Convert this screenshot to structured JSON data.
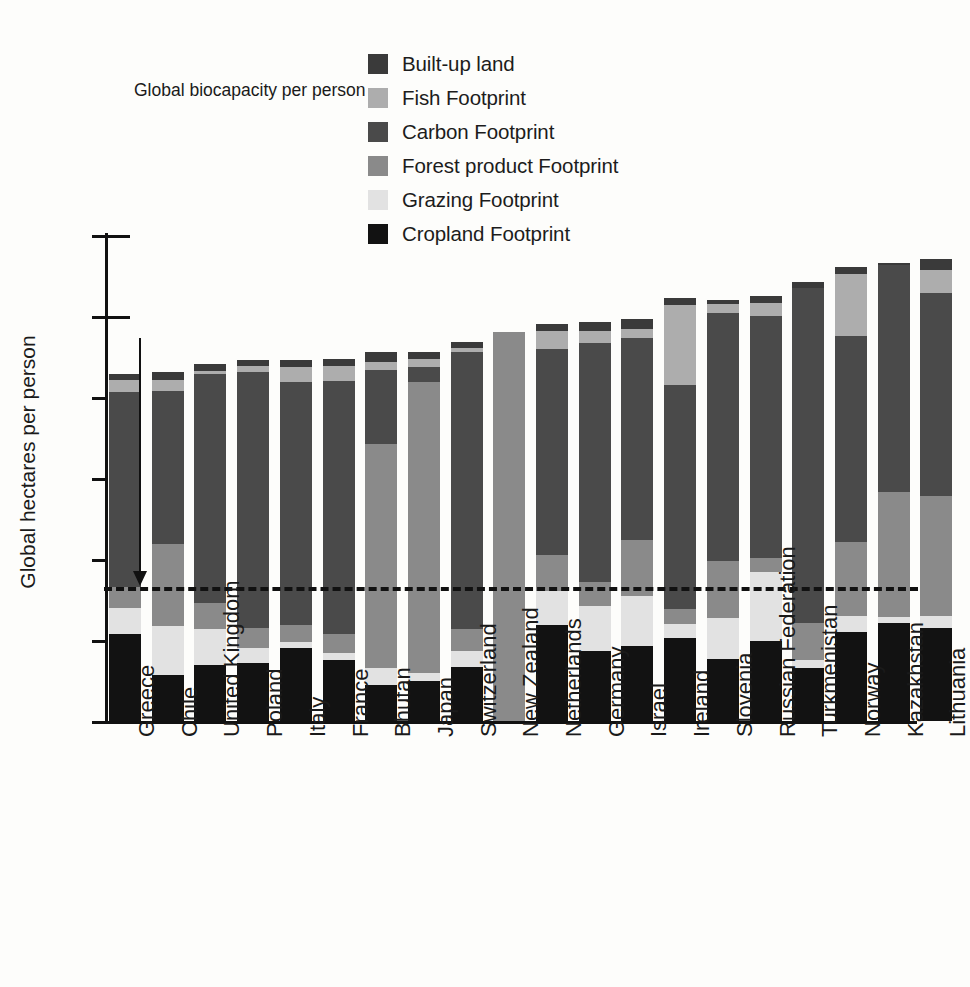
{
  "chart_data": {
    "type": "bar",
    "subtype": "stacked-vertical",
    "title": "",
    "xlabel": "",
    "ylabel": "Global hectares per person",
    "ylim": [
      0,
      6
    ],
    "ytick_labels": [
      "0",
      "1",
      "2",
      "3",
      "4",
      "5",
      "6"
    ],
    "ytick_values": [
      0,
      1,
      2,
      3,
      4,
      5,
      6
    ],
    "grid": false,
    "legend_position": "top-center",
    "annotation": {
      "text": "Global biocapacity per person",
      "value": 1.65,
      "line_style": "dashed"
    },
    "series": [
      {
        "name": "Cropland Footprint",
        "color": "#121212",
        "values": [
          1.08,
          0.57,
          0.69,
          0.72,
          0.9,
          0.75,
          0.45,
          0.5,
          0.67,
          0.0,
          1.19,
          0.87,
          0.93,
          1.03,
          0.77,
          0.99,
          0.66,
          1.1,
          1.21,
          1.15
        ]
      },
      {
        "name": "Grazing Footprint",
        "color": "#e2e2e2",
        "values": [
          0.31,
          0.6,
          0.45,
          0.18,
          0.08,
          0.09,
          0.2,
          0.09,
          0.2,
          0.0,
          0.42,
          0.55,
          0.61,
          0.17,
          0.5,
          0.85,
          0.09,
          0.2,
          0.08,
          0.15
        ]
      },
      {
        "name": "Forest product Footprint",
        "color": "#8a8a8a",
        "values": [
          0.26,
          1.02,
          0.32,
          0.25,
          0.21,
          0.24,
          2.77,
          3.6,
          0.27,
          4.8,
          0.44,
          0.3,
          0.7,
          0.18,
          0.7,
          0.17,
          0.46,
          0.91,
          1.54,
          1.48
        ]
      },
      {
        "name": "Carbon Footprint",
        "color": "#4a4a4a",
        "values": [
          2.41,
          1.89,
          2.82,
          3.16,
          3.0,
          3.12,
          0.91,
          0.18,
          3.41,
          0.0,
          2.54,
          2.95,
          2.49,
          2.77,
          3.07,
          2.99,
          4.13,
          2.54,
          2.8,
          2.5
        ]
      },
      {
        "name": "Fish Footprint",
        "color": "#adadad",
        "values": [
          0.15,
          0.13,
          0.04,
          0.07,
          0.18,
          0.18,
          0.1,
          0.1,
          0.05,
          0.0,
          0.22,
          0.14,
          0.11,
          0.98,
          0.11,
          0.16,
          0.0,
          0.77,
          0.0,
          0.29
        ]
      },
      {
        "name": "Built-up land",
        "color": "#3a3a3a",
        "values": [
          0.08,
          0.1,
          0.09,
          0.08,
          0.09,
          0.09,
          0.12,
          0.08,
          0.08,
          0.0,
          0.09,
          0.12,
          0.12,
          0.09,
          0.05,
          0.09,
          0.08,
          0.09,
          0.02,
          0.13
        ]
      }
    ],
    "categories": [
      "Greece",
      "Chile",
      "United Kingdom",
      "Poland",
      "Italy",
      "France",
      "Bhutan",
      "Japan",
      "Switzerland",
      "New Zealand",
      "Netherlands",
      "Germany",
      "Israel",
      "Ireland",
      "Slovenia",
      "Russian Federation",
      "Turkmenistan",
      "Norway",
      "Kazakhstan",
      "Lithuania"
    ],
    "totals": [
      4.29,
      4.31,
      4.41,
      4.46,
      4.46,
      4.47,
      4.55,
      4.55,
      4.68,
      4.8,
      4.9,
      4.93,
      4.96,
      5.22,
      5.2,
      5.25,
      5.42,
      5.61,
      5.65,
      5.7
    ]
  },
  "legend": {
    "items": [
      {
        "label": "Built-up land",
        "color": "#3a3a3a"
      },
      {
        "label": "Fish Footprint",
        "color": "#adadad"
      },
      {
        "label": "Carbon Footprint",
        "color": "#4a4a4a"
      },
      {
        "label": "Forest product Footprint",
        "color": "#8a8a8a"
      },
      {
        "label": "Grazing Footprint",
        "color": "#e2e2e2"
      },
      {
        "label": "Cropland Footprint",
        "color": "#121212"
      }
    ]
  }
}
